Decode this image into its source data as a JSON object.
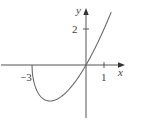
{
  "chart_data": {
    "type": "line",
    "title": "",
    "xlabel": "x",
    "ylabel": "y",
    "function": "y = x*sqrt(x+3)",
    "x_ticks": [
      {
        "value": -3,
        "label": "−3"
      },
      {
        "value": 1,
        "label": "1"
      }
    ],
    "y_ticks": [
      {
        "value": 2,
        "label": "2"
      }
    ],
    "xlim": [
      -4.8,
      2.1
    ],
    "ylim": [
      -3.0,
      3.6
    ],
    "grid": false,
    "legend": null,
    "series": [
      {
        "name": "curve",
        "x": [
          -3,
          -2.9,
          -2.75,
          -2.5,
          -2.25,
          -2,
          -1.75,
          -1.5,
          -1.25,
          -1,
          -0.75,
          -0.5,
          -0.25,
          0,
          0.25,
          0.5,
          0.75,
          1,
          1.25,
          1.4
        ],
        "y": [
          0,
          -0.92,
          -1.38,
          -1.77,
          -1.95,
          -2.0,
          -1.96,
          -1.84,
          -1.65,
          -1.41,
          -1.45,
          -0.79,
          -0.45,
          0,
          0.45,
          0.94,
          1.45,
          2.0,
          2.58,
          2.94
        ]
      }
    ],
    "key_points": {
      "x_intercepts": [
        -3,
        0
      ],
      "minimum": {
        "x": -2,
        "y": -2
      }
    }
  },
  "labels": {
    "x_axis": "x",
    "y_axis": "y",
    "tick_neg3": "−3",
    "tick_1": "1",
    "tick_2": "2"
  }
}
